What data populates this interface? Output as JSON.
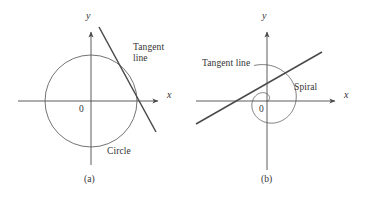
{
  "figure": {
    "caption_a": "(a)",
    "caption_b": "(b)",
    "stroke_color": "#4a4a4a",
    "curve_color": "#5a5a5a",
    "text_color": "#333333",
    "background": "#ffffff"
  },
  "panel_a": {
    "name": "circle-tangent-diagram",
    "axis_y_label": "y",
    "axis_x_label": "x",
    "origin_label": "0",
    "tangent_label": "Tangent\nline",
    "curve_label": "Circle",
    "caption": "(a)"
  },
  "panel_b": {
    "name": "spiral-tangent-diagram",
    "axis_y_label": "y",
    "axis_x_label": "x",
    "origin_label": "0",
    "tangent_label": "Tangent line",
    "curve_label": "Spiral",
    "caption": "(b)"
  },
  "chart_data": {
    "type": "line",
    "title": "",
    "panels": [
      {
        "id": "a",
        "caption": "(a)",
        "curve": "circle",
        "curve_label": "Circle",
        "center": [
          91,
          101
        ],
        "radius": 46,
        "axes": {
          "x_axis": {
            "from": [
              18,
              101
            ],
            "to": [
              163,
              101
            ],
            "arrow": true,
            "label": "x"
          },
          "y_axis": {
            "from": [
              91,
              165
            ],
            "to": [
              91,
              27
            ],
            "arrow": true,
            "label": "y"
          },
          "origin_label": "0"
        },
        "tangent_line": {
          "label": "Tangent line",
          "from": [
            99,
            27
          ],
          "to": [
            156,
            132
          ],
          "touch_point": [
            130,
            86
          ]
        }
      },
      {
        "id": "b",
        "caption": "(b)",
        "curve": "archimedean-spiral",
        "curve_label": "Spiral",
        "center": [
          267,
          101
        ],
        "spiral_a": 0,
        "spiral_b": 4.6,
        "spiral_theta_range": [
          0,
          8.2
        ],
        "axes": {
          "x_axis": {
            "from": [
              196,
              101
            ],
            "to": [
              340,
              101
            ],
            "arrow": true,
            "label": "x"
          },
          "y_axis": {
            "from": [
              267,
              170
            ],
            "to": [
              267,
              27
            ],
            "arrow": true,
            "label": "y"
          },
          "origin_label": "0"
        },
        "tangent_line": {
          "label": "Tangent line",
          "from": [
            196,
            124
          ],
          "to": [
            322,
            52
          ],
          "touch_point": [
            253,
            89
          ]
        }
      }
    ]
  }
}
